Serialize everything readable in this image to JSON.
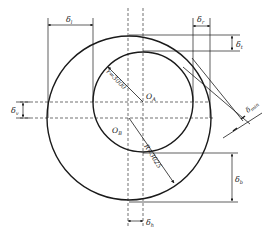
{
  "diagram": {
    "type": "eccentric-circles-clearance",
    "colors": {
      "stroke": "#1a1a1a",
      "background": "#ffffff"
    },
    "circles": {
      "inner": {
        "label_center": "O",
        "label_sub": "A",
        "radius_label": "r=3000"
      },
      "outer": {
        "label_center": "O",
        "label_sub": "B",
        "radius_label": "R=3025"
      }
    },
    "dimensions": {
      "top_left": {
        "symbol": "δ",
        "sub": "l"
      },
      "top_right": {
        "symbol": "δ",
        "sub": "r"
      },
      "right_top": {
        "symbol": "δ",
        "sub": "t"
      },
      "left_middle": {
        "symbol": "δ",
        "sub": "v"
      },
      "right_bottom": {
        "symbol": "δ",
        "sub": "b"
      },
      "bottom": {
        "symbol": "δ",
        "sub": "h"
      },
      "diagonal": {
        "symbol": "δ",
        "sub": "min"
      }
    }
  }
}
